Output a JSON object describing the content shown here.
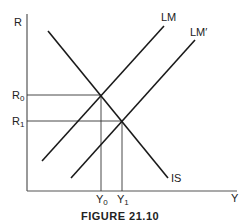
{
  "figure": {
    "caption": "FIGURE 21.10",
    "y_axis_label": "R",
    "x_axis_label": "Y",
    "r_ticks": [
      {
        "main": "R",
        "sub": "0"
      },
      {
        "main": "R",
        "sub": "1"
      }
    ],
    "y_ticks": [
      {
        "main": "Y",
        "sub": "0"
      },
      {
        "main": "Y",
        "sub": "1"
      }
    ],
    "curves": {
      "lm": "LM",
      "lm_prime": "LM′",
      "is": "IS"
    },
    "line_color": "#1a1a1a",
    "guide_color": "#333333"
  }
}
